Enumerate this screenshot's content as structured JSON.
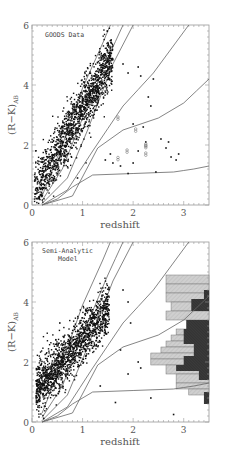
{
  "chart_data": [
    {
      "type": "scatter",
      "title": "GOODS Data",
      "xlabel": "redshift",
      "ylabel": "(R-K)_AB",
      "xlim": [
        0,
        3.5
      ],
      "ylim": [
        0,
        6
      ],
      "xticks": [
        0,
        1,
        2,
        3
      ],
      "yticks": [
        0,
        2,
        4
      ],
      "grid": false,
      "annotation": "GOODS Data",
      "tracks": [
        {
          "name": "track1",
          "points": [
            [
              0.2,
              0.3
            ],
            [
              0.6,
              2.0
            ],
            [
              1.0,
              3.9
            ],
            [
              1.4,
              5.4
            ],
            [
              1.55,
              6.0
            ]
          ]
        },
        {
          "name": "track2",
          "points": [
            [
              0.2,
              0.15
            ],
            [
              0.6,
              1.2
            ],
            [
              1.0,
              2.9
            ],
            [
              1.5,
              4.9
            ],
            [
              1.8,
              6.0
            ]
          ]
        },
        {
          "name": "track3",
          "points": [
            [
              0.2,
              0.05
            ],
            [
              0.7,
              0.9
            ],
            [
              1.1,
              2.5
            ],
            [
              1.6,
              4.7
            ],
            [
              2.0,
              6.0
            ]
          ]
        },
        {
          "name": "track4",
          "points": [
            [
              0.2,
              0.0
            ],
            [
              0.7,
              0.5
            ],
            [
              1.2,
              1.8
            ],
            [
              1.8,
              3.3
            ],
            [
              2.4,
              4.4
            ],
            [
              3.1,
              6.0
            ]
          ]
        },
        {
          "name": "track5",
          "points": [
            [
              0.2,
              0.0
            ],
            [
              0.8,
              0.3
            ],
            [
              1.3,
              1.9
            ],
            [
              1.8,
              2.5
            ],
            [
              2.5,
              2.9
            ],
            [
              3.0,
              3.4
            ],
            [
              3.5,
              4.2
            ]
          ]
        },
        {
          "name": "track6",
          "points": [
            [
              0.2,
              0.0
            ],
            [
              0.5,
              0.2
            ],
            [
              0.8,
              0.6
            ],
            [
              1.2,
              1.0
            ],
            [
              2.0,
              1.05
            ],
            [
              2.8,
              1.1
            ],
            [
              3.2,
              1.2
            ],
            [
              3.5,
              1.3
            ]
          ]
        }
      ],
      "scatter_summary": {
        "n_points_approx": 1500,
        "main_locus": "z 0-1.6, R-K rising ~0.4 to ~5",
        "outliers": "z 1.4-2.9, R-K 1-4.7"
      },
      "open_markers": [
        [
          1.7,
          1.55
        ],
        [
          1.7,
          2.9
        ],
        [
          1.88,
          1.8
        ],
        [
          2.05,
          2.5
        ],
        [
          2.25,
          1.7
        ],
        [
          2.25,
          1.95
        ],
        [
          2.25,
          2.0
        ]
      ]
    },
    {
      "type": "scatter",
      "title": "Semi-Analytic Model",
      "xlabel": "redshift",
      "ylabel": "(R-K)_AB",
      "xlim": [
        0,
        3.5
      ],
      "ylim": [
        0,
        6
      ],
      "xticks": [
        0,
        1,
        2,
        3
      ],
      "yticks": [
        0,
        2,
        4
      ],
      "grid": false,
      "annotation": [
        "Semi-Analytic",
        "Model"
      ],
      "scatter_summary": {
        "n_points_approx": 1500,
        "main_locus": "z 0.1-1.5, R-K 0.5-4.3"
      },
      "histograms": [
        {
          "name": "light-hatched",
          "orientation": "horizontal",
          "baseline_x": 3.5,
          "bins_y": [
            [
              4.6,
              4.9
            ],
            [
              4.3,
              4.6
            ],
            [
              4.0,
              4.3
            ],
            [
              3.7,
              4.0
            ],
            [
              3.4,
              3.7
            ],
            [
              2.9,
              3.1
            ],
            [
              2.7,
              2.9
            ],
            [
              2.5,
              2.7
            ],
            [
              2.3,
              2.5
            ],
            [
              2.1,
              2.3
            ],
            [
              1.9,
              2.1
            ],
            [
              1.6,
              1.9
            ],
            [
              1.3,
              1.6
            ],
            [
              1.1,
              1.3
            ],
            [
              0.9,
              1.1
            ]
          ],
          "left_x": [
            2.65,
            2.65,
            2.65,
            2.75,
            2.65,
            2.85,
            2.75,
            2.65,
            2.55,
            2.35,
            2.35,
            2.65,
            2.85,
            2.85,
            3.1
          ]
        },
        {
          "name": "dark-hatched",
          "orientation": "horizontal",
          "baseline_x": 3.5,
          "bins_y": [
            [
              4.1,
              4.4
            ],
            [
              3.7,
              4.1
            ],
            [
              3.1,
              3.4
            ],
            [
              2.6,
              3.1
            ],
            [
              2.2,
              2.6
            ],
            [
              1.9,
              2.2
            ],
            [
              1.7,
              1.9
            ],
            [
              1.4,
              1.7
            ],
            [
              0.6,
              1.0
            ]
          ],
          "left_x": [
            3.4,
            3.15,
            3.05,
            3.0,
            3.2,
            3.0,
            2.85,
            3.3,
            3.4
          ]
        }
      ]
    }
  ],
  "panels": {
    "top": {
      "annotation": "GOODS Data",
      "xlabel": "redshift",
      "ylabel": "(R−K)",
      "ylabel_sub": "AB",
      "xticks": [
        "0",
        "1",
        "2",
        "3"
      ],
      "yticks": [
        "0",
        "2",
        "4",
        "6"
      ]
    },
    "bottom": {
      "annotation_line1": "Semi-Analytic",
      "annotation_line2": "Model",
      "xlabel": "redshift",
      "ylabel": "(R−K)",
      "ylabel_sub": "AB",
      "xticks": [
        "0",
        "1",
        "2",
        "3"
      ],
      "yticks": [
        "0",
        "2",
        "4",
        "6"
      ]
    }
  },
  "colors": {
    "axis": "#999999",
    "points": "#111111",
    "curve": "#666666",
    "hist_light": "#cfcfcf",
    "hist_dark": "#333333"
  }
}
